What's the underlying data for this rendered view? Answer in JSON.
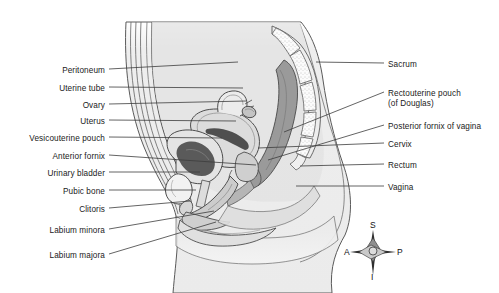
{
  "figure": {
    "view": "midsagittal",
    "background_color": "#ffffff",
    "line_color": "#4a4a4a",
    "text_color": "#1a1a1a"
  },
  "labels_left": [
    {
      "text": "Peritoneum",
      "x": 105,
      "y": 72,
      "leader_x2": 238,
      "leader_y2": 62
    },
    {
      "text": "Uterine tube",
      "x": 105,
      "y": 90,
      "leader_x2": 243,
      "leader_y2": 88
    },
    {
      "text": "Ovary",
      "x": 105,
      "y": 107,
      "leader_x2": 246,
      "leader_y2": 101
    },
    {
      "text": "Uterus",
      "x": 105,
      "y": 123,
      "leader_x2": 236,
      "leader_y2": 121
    },
    {
      "text": "Vesicouterine pouch",
      "x": 105,
      "y": 140,
      "leader_x2": 222,
      "leader_y2": 138
    },
    {
      "text": "Anterior fornix",
      "x": 105,
      "y": 158,
      "leader_x2": 256,
      "leader_y2": 165
    },
    {
      "text": "Urinary bladder",
      "x": 105,
      "y": 175,
      "leader_x2": 200,
      "leader_y2": 172
    },
    {
      "text": "Pubic bone",
      "x": 105,
      "y": 193,
      "leader_x2": 196,
      "leader_y2": 190
    },
    {
      "text": "Clitoris",
      "x": 105,
      "y": 211,
      "leader_x2": 190,
      "leader_y2": 201
    },
    {
      "text": "Labium minora",
      "x": 105,
      "y": 232,
      "leader_x2": 214,
      "leader_y2": 211
    },
    {
      "text": "Labium majora",
      "x": 105,
      "y": 257,
      "leader_x2": 216,
      "leader_y2": 222
    }
  ],
  "labels_right": [
    {
      "text": "Sacrum",
      "text2": null,
      "x": 388,
      "y": 66,
      "leader_x2": 316,
      "leader_y2": 64
    },
    {
      "text": "Rectouterine pouch",
      "text2": "(of Douglas)",
      "x": 388,
      "y": 95,
      "leader_x2": 284,
      "leader_y2": 132
    },
    {
      "text": "Posterior fornix of vagina",
      "text2": null,
      "x": 388,
      "y": 128,
      "leader_x2": 268,
      "leader_y2": 160
    },
    {
      "text": "Cervix",
      "text2": null,
      "x": 388,
      "y": 146,
      "leader_x2": 258,
      "leader_y2": 148
    },
    {
      "text": "Rectum",
      "text2": null,
      "x": 388,
      "y": 167,
      "leader_x2": 300,
      "leader_y2": 166
    },
    {
      "text": "Vagina",
      "text2": null,
      "x": 388,
      "y": 189,
      "leader_x2": 296,
      "leader_y2": 186
    }
  ],
  "compass": {
    "center_x": 373,
    "center_y": 252,
    "superior": "S",
    "inferior": "I",
    "anterior": "A",
    "posterior": "P"
  },
  "anatomy_structures": [
    "abdominal wall",
    "peritoneum",
    "uterine tube",
    "ovary",
    "uterus",
    "vesicouterine pouch",
    "anterior fornix",
    "urinary bladder",
    "pubic bone",
    "clitoris",
    "labium minora",
    "labium majora",
    "sacrum",
    "rectouterine pouch (of Douglas)",
    "posterior fornix of vagina",
    "cervix",
    "rectum",
    "vagina"
  ]
}
